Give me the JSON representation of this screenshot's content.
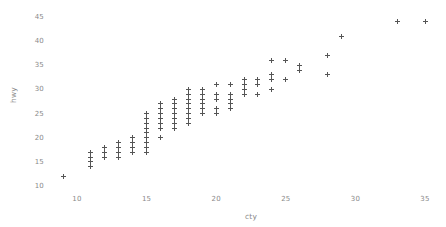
{
  "chart_data": {
    "type": "scatter",
    "title": "",
    "subtitle": "",
    "xlabel": "cty",
    "ylabel": "hwy",
    "xlim": [
      8.2,
      36.0
    ],
    "ylim": [
      9.2,
      46.2
    ],
    "xticks": [
      10,
      15,
      20,
      25,
      30,
      35
    ],
    "xtick_labels": [
      "10",
      "15",
      "20",
      "25",
      "30",
      "35"
    ],
    "yticks": [
      10,
      15,
      20,
      25,
      30,
      35,
      40,
      45
    ],
    "ytick_labels": [
      "10",
      "15",
      "20",
      "25",
      "30",
      "35",
      "40",
      "45"
    ],
    "grid": false,
    "legend": null,
    "marker": "plus",
    "marker_color": "#555555",
    "marker_size_px": 5,
    "background_color": "#ffffff",
    "axis_label_color": "#8a8a8a",
    "annotations": [],
    "series": [
      {
        "name": "mpg",
        "x": [
          9,
          11,
          11,
          11,
          11,
          12,
          12,
          12,
          13,
          13,
          13,
          13,
          14,
          14,
          14,
          14,
          15,
          15,
          15,
          15,
          15,
          15,
          15,
          15,
          15,
          16,
          16,
          16,
          16,
          16,
          16,
          16,
          17,
          17,
          17,
          17,
          17,
          17,
          17,
          18,
          18,
          18,
          18,
          18,
          18,
          18,
          18,
          19,
          19,
          19,
          19,
          19,
          19,
          20,
          20,
          20,
          20,
          20,
          21,
          21,
          21,
          21,
          21,
          22,
          22,
          22,
          22,
          23,
          23,
          23,
          24,
          24,
          24,
          24,
          25,
          25,
          26,
          26,
          28,
          28,
          29,
          33,
          35
        ],
        "y": [
          12,
          14,
          15,
          16,
          17,
          16,
          17,
          18,
          16,
          17,
          18,
          19,
          17,
          18,
          19,
          20,
          17,
          18,
          19,
          20,
          21,
          22,
          23,
          24,
          25,
          20,
          22,
          23,
          24,
          25,
          26,
          27,
          22,
          23,
          24,
          25,
          26,
          27,
          28,
          23,
          24,
          25,
          26,
          27,
          28,
          29,
          30,
          25,
          26,
          27,
          28,
          29,
          30,
          25,
          26,
          28,
          29,
          31,
          26,
          27,
          28,
          29,
          31,
          29,
          30,
          31,
          32,
          29,
          31,
          32,
          30,
          32,
          33,
          36,
          32,
          36,
          34,
          35,
          33,
          37,
          41,
          44,
          44
        ]
      }
    ]
  },
  "figure": {
    "width": 446,
    "height": 227
  }
}
